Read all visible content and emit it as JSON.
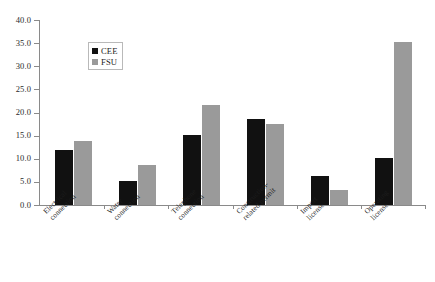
{
  "chart_data": {
    "type": "bar",
    "title": "",
    "subtitle": "",
    "xlabel": "",
    "ylabel": "",
    "ylim": [
      0.0,
      40.0
    ],
    "ytick_step": 5.0,
    "ytick_labels": [
      "0.0",
      "5.0",
      "10.0",
      "15.0",
      "20.0",
      "25.0",
      "30.0",
      "35.0",
      "40.0"
    ],
    "ytick_values": [
      0.0,
      5.0,
      10.0,
      15.0,
      20.0,
      25.0,
      30.0,
      35.0,
      40.0
    ],
    "grid": false,
    "legend_position": "upper-left-inside",
    "categories": [
      "Electrical connection",
      "Water connection",
      "Telephone connection",
      "Construction-related permit",
      "Import license",
      "Operating license"
    ],
    "category_lines": [
      [
        "Electrical",
        "connection"
      ],
      [
        "Water",
        "connection"
      ],
      [
        "Telephone",
        "connection"
      ],
      [
        "Construction-",
        "related permit"
      ],
      [
        "Import",
        "license"
      ],
      [
        "Operating",
        "license"
      ]
    ],
    "series": [
      {
        "name": "CEE",
        "color": "#111111",
        "values": [
          11.8,
          5.2,
          15.2,
          18.5,
          6.2,
          10.2
        ]
      },
      {
        "name": "FSU",
        "color": "#9a9a9a",
        "values": [
          13.9,
          8.6,
          21.7,
          17.5,
          3.2,
          35.2
        ]
      }
    ],
    "annotations": []
  },
  "legend": {
    "entries": [
      {
        "label": "CEE",
        "color": "#111111"
      },
      {
        "label": "FSU",
        "color": "#9a9a9a"
      }
    ]
  },
  "colors": {
    "series_cee": "#111111",
    "series_fsu": "#9a9a9a",
    "axis": "#8a8a8a",
    "text": "#1c1c1c",
    "background": "#ffffff"
  }
}
